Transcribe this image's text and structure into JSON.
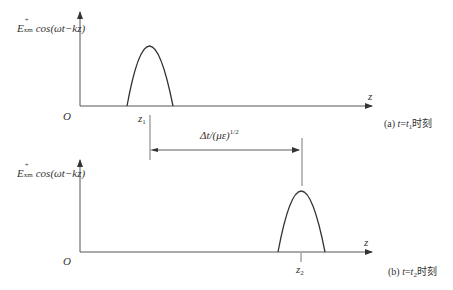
{
  "figure": {
    "panels": [
      {
        "id": "a",
        "ylabel": {
          "base": "E",
          "sup": "+",
          "sub": "xm",
          "rest": "cos(ωt−kz)"
        },
        "origin": "O",
        "xaxis": "z",
        "pulse_label": {
          "base": "z",
          "sub": "1"
        },
        "caption": {
          "prefix": "(a) ",
          "var": "t",
          "eq": "=",
          "var2": "t",
          "sub": "1",
          "suffix": "时刻"
        }
      },
      {
        "id": "b",
        "ylabel": {
          "base": "E",
          "sup": "+",
          "sub": "xm",
          "rest": "cos(ωt−kz)"
        },
        "origin": "O",
        "xaxis": "z",
        "pulse_label": {
          "base": "z",
          "sub": "2"
        },
        "caption": {
          "prefix": "(b) ",
          "var": "t",
          "eq": "=",
          "var2": "t",
          "sub": "2",
          "suffix": "时刻"
        }
      }
    ],
    "displacement": {
      "text": "Δt/(με)",
      "sup": "1/2"
    },
    "colors": {
      "line": "#333333",
      "background": "#ffffff"
    }
  }
}
